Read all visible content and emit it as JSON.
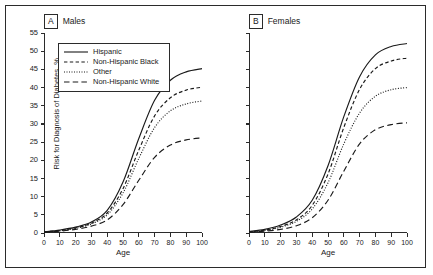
{
  "figure": {
    "panels": [
      {
        "letter": "A",
        "name": "Males"
      },
      {
        "letter": "B",
        "name": "Females"
      }
    ],
    "legend": [
      {
        "label": "Hispanic",
        "style": "solid"
      },
      {
        "label": "Non-Hispanic Black",
        "style": "dashed"
      },
      {
        "label": "Other",
        "style": "dotted"
      },
      {
        "label": "Non-Hispanic White",
        "style": "longdash"
      }
    ]
  },
  "chart_data": [
    {
      "type": "line",
      "title": "Males",
      "panel_letter": "A",
      "xlabel": "Age",
      "ylabel": "Risk for Diagnosis of Diabetes, %",
      "xlim": [
        0,
        100
      ],
      "ylim": [
        0,
        55
      ],
      "xticks": [
        0,
        10,
        20,
        30,
        40,
        50,
        60,
        70,
        80,
        90,
        100
      ],
      "yticks": [
        0,
        5,
        10,
        15,
        20,
        25,
        30,
        35,
        40,
        45,
        50,
        55
      ],
      "grid": false,
      "legend_position": "upper-left-inset",
      "x": [
        0,
        10,
        20,
        30,
        40,
        50,
        60,
        70,
        80,
        90,
        100
      ],
      "series": [
        {
          "name": "Hispanic",
          "style": "solid",
          "values": [
            0.3,
            0.8,
            1.6,
            3.0,
            6.2,
            14.0,
            26.0,
            36.5,
            42.0,
            44.3,
            45.2
          ]
        },
        {
          "name": "Non-Hispanic Black",
          "style": "dashed",
          "values": [
            0.3,
            0.7,
            1.4,
            2.7,
            5.5,
            12.2,
            22.8,
            32.2,
            37.2,
            39.3,
            40.1
          ]
        },
        {
          "name": "Other",
          "style": "dotted",
          "values": [
            0.2,
            0.6,
            1.3,
            2.5,
            5.0,
            11.0,
            20.5,
            29.0,
            33.6,
            35.5,
            36.3
          ]
        },
        {
          "name": "Non-Hispanic White",
          "style": "longdash",
          "values": [
            0.2,
            0.5,
            1.0,
            1.9,
            3.6,
            7.8,
            14.5,
            20.8,
            24.2,
            25.6,
            26.2
          ]
        }
      ]
    },
    {
      "type": "line",
      "title": "Females",
      "panel_letter": "B",
      "xlabel": "Age",
      "ylabel": "Risk for Diagnosis of Diabetes, %",
      "xlim": [
        0,
        100
      ],
      "ylim": [
        0,
        55
      ],
      "xticks": [
        0,
        10,
        20,
        30,
        40,
        50,
        60,
        70,
        80,
        90,
        100
      ],
      "yticks": [
        0,
        5,
        10,
        15,
        20,
        25,
        30,
        35,
        40,
        45,
        50,
        55
      ],
      "grid": false,
      "legend_position": "none",
      "x": [
        0,
        10,
        20,
        30,
        40,
        50,
        60,
        70,
        80,
        90,
        100
      ],
      "series": [
        {
          "name": "Hispanic",
          "style": "solid",
          "values": [
            0.4,
            1.0,
            2.2,
            4.4,
            9.0,
            18.5,
            32.0,
            43.0,
            49.0,
            51.3,
            52.1
          ]
        },
        {
          "name": "Non-Hispanic Black",
          "style": "dashed",
          "values": [
            0.3,
            0.8,
            1.8,
            3.6,
            7.6,
            16.2,
            29.0,
            39.5,
            45.2,
            47.3,
            48.1
          ]
        },
        {
          "name": "Other",
          "style": "dotted",
          "values": [
            0.3,
            0.7,
            1.6,
            3.2,
            6.6,
            13.8,
            24.5,
            33.0,
            37.6,
            39.4,
            40.0
          ]
        },
        {
          "name": "Non-Hispanic White",
          "style": "longdash",
          "values": [
            0.2,
            0.5,
            1.0,
            2.0,
            4.2,
            9.0,
            17.0,
            24.5,
            28.4,
            29.8,
            30.3
          ]
        }
      ]
    }
  ]
}
